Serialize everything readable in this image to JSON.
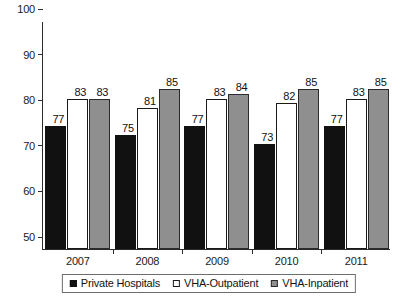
{
  "chart_data": {
    "type": "bar",
    "title": "",
    "subtitle": "",
    "xlabel": "",
    "ylabel": "",
    "categories": [
      "2007",
      "2008",
      "2009",
      "2010",
      "2011"
    ],
    "series": [
      {
        "name": "Private Hospitals",
        "color": "#111111",
        "values": [
          77,
          75,
          77,
          73,
          77
        ]
      },
      {
        "name": "VHA-Outpatient",
        "color": "#ffffff",
        "values": [
          83,
          81,
          83,
          82,
          83
        ]
      },
      {
        "name": "VHA-Inpatient",
        "color": "#8f8f8f",
        "values": [
          83,
          85,
          84,
          85,
          85
        ]
      }
    ],
    "ylim": [
      50,
      100
    ],
    "yticks": [
      50,
      60,
      70,
      80,
      90,
      100
    ],
    "ytick_labels": [
      "50",
      "60",
      "70",
      "80",
      "90",
      "100"
    ],
    "grid": false,
    "legend_position": "bottom",
    "data_labels": true
  },
  "legend": {
    "items": [
      {
        "label": "Private Hospitals",
        "swatch": "filled-black-square-icon"
      },
      {
        "label": "VHA-Outpatient",
        "swatch": "hollow-white-square-icon"
      },
      {
        "label": "VHA-Inpatient",
        "swatch": "filled-gray-square-icon"
      }
    ]
  }
}
